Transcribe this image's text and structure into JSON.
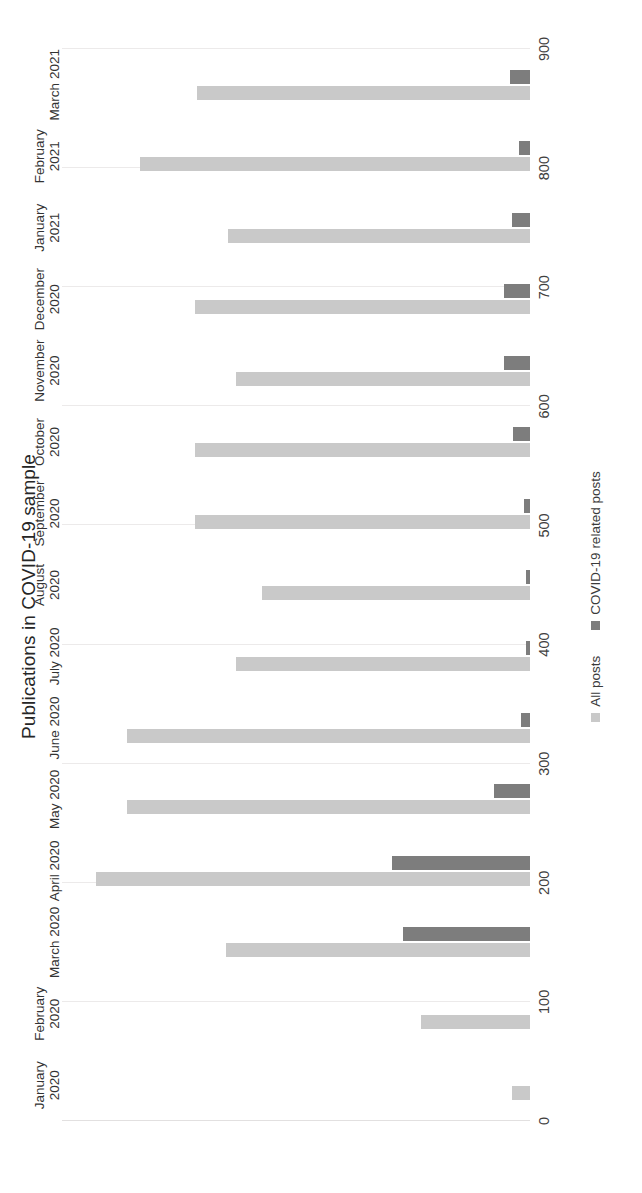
{
  "chart_data": {
    "type": "bar",
    "orientation": "vertical",
    "title": "Publications in COVID-19 sample",
    "xlabel": "",
    "ylabel": "",
    "ylim": [
      0,
      900
    ],
    "ytick_step": 100,
    "ytick_labels": [
      "0",
      "100",
      "200",
      "300",
      "400",
      "500",
      "600",
      "700",
      "800",
      "900"
    ],
    "grid": true,
    "legend_position": "bottom",
    "categories": [
      "January 2020",
      "February 2020",
      "March 2020",
      "April 2020",
      "May 2020",
      "June 2020",
      "July 2020",
      "August 2020",
      "September 2020",
      "October 2020",
      "November 2020",
      "December 2020",
      "January 2021",
      "February 2021",
      "March 2021"
    ],
    "category_lines": [
      [
        "January",
        "2020"
      ],
      [
        "February",
        "2020"
      ],
      [
        "March 2020",
        ""
      ],
      [
        "April 2020",
        ""
      ],
      [
        "May 2020",
        ""
      ],
      [
        "June 2020",
        ""
      ],
      [
        "July 2020",
        ""
      ],
      [
        "August",
        "2020"
      ],
      [
        "September",
        "2020"
      ],
      [
        "October",
        "2020"
      ],
      [
        "November",
        "2020"
      ],
      [
        "December",
        "2020"
      ],
      [
        "January",
        "2021"
      ],
      [
        "February",
        "2021"
      ],
      [
        "March 2021",
        ""
      ]
    ],
    "series": [
      {
        "name": "All posts",
        "color": "#c9c9c9",
        "values": [
          35,
          210,
          585,
          835,
          775,
          775,
          565,
          515,
          645,
          645,
          565,
          645,
          580,
          750,
          640
        ]
      },
      {
        "name": "COVID-19 related posts",
        "color": "#7d7d7d",
        "values": [
          0,
          0,
          245,
          265,
          70,
          18,
          8,
          8,
          12,
          32,
          50,
          50,
          35,
          22,
          38
        ]
      }
    ]
  },
  "legend": {
    "items": [
      {
        "label": "All posts",
        "swatch": "all"
      },
      {
        "label": "COVID-19 related posts",
        "swatch": "covid"
      }
    ]
  }
}
